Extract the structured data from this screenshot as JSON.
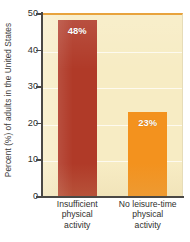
{
  "chart_data": {
    "type": "bar",
    "title": "",
    "subtitle": "",
    "xlabel": "",
    "ylabel": "Percent (%) of adults in the United States",
    "categories": [
      "Insufficient physical activity",
      "No leisure-time physical activity"
    ],
    "category_lines": [
      [
        "Insufficient",
        "physical",
        "activity"
      ],
      [
        "No leisure-time",
        "physical",
        "activity"
      ]
    ],
    "values": [
      48,
      23
    ],
    "data_labels": [
      "48%",
      "23%"
    ],
    "bar_colors": [
      "#b03a28",
      "#f3921e"
    ],
    "ylim": [
      0,
      50
    ],
    "ytick_values": [
      0,
      10,
      20,
      30,
      40,
      50
    ],
    "ytick_labels": [
      "0",
      "10",
      "20",
      "30",
      "40",
      "50"
    ],
    "grid": true,
    "gridlines_at": [
      10,
      20,
      30,
      40
    ],
    "legend": null,
    "legend_position": "none",
    "plot_background_color": "#f7ecc4",
    "figure_background_color": "#ffffff",
    "gridline_color": "#ffffff",
    "axis_color": "#4a4845",
    "plot_top_border_color": "#e8a33d"
  }
}
